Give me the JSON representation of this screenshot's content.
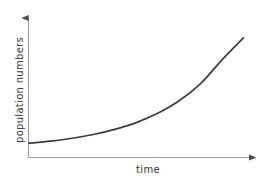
{
  "chart_data": {
    "type": "line",
    "title": "",
    "subtitle": "",
    "xlabel": "time",
    "ylabel": "population numbers",
    "grid": false,
    "legend": null,
    "annotations": [],
    "axis_style": {
      "arrow_heads": true,
      "tick_labels": false,
      "ticks": false,
      "spines": [
        "left",
        "bottom"
      ],
      "axis_color": "#9a9a9a",
      "curve_color": "#3d3d3d",
      "background": "#ffffff"
    },
    "xlim": [
      0,
      10
    ],
    "ylim": [
      0,
      10
    ],
    "series": [
      {
        "name": "exponential growth",
        "description": "J-shaped exponential population growth curve",
        "x": [
          0,
          1,
          2,
          3,
          4,
          5,
          6,
          7,
          8,
          9,
          10
        ],
        "y": [
          1.0,
          1.17,
          1.42,
          1.74,
          2.18,
          2.76,
          3.55,
          4.62,
          6.09,
          8.12,
          10.0
        ]
      }
    ]
  }
}
